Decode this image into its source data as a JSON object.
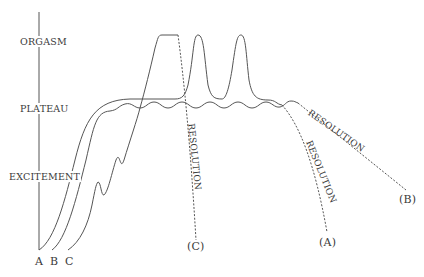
{
  "diagram": {
    "type": "sexual response cycle phases",
    "axis": {
      "phases": [
        "ORGASM",
        "PLATEAU",
        "EXCITEMENT"
      ]
    },
    "curves": [
      {
        "id": "A",
        "start_label": "A",
        "end_label": "(A)",
        "description": "excitement to plateau with multiple orgasms, resolution"
      },
      {
        "id": "B",
        "start_label": "B",
        "end_label": "(B)",
        "description": "excitement to prolonged plateau without orgasm, slow resolution"
      },
      {
        "id": "C",
        "start_label": "C",
        "end_label": "(C)",
        "description": "fluctuating excitement to single orgasm, rapid resolution"
      }
    ],
    "resolution_labels": [
      "RESOLUTION",
      "RESOLUTION",
      "RESOLUTION"
    ]
  }
}
